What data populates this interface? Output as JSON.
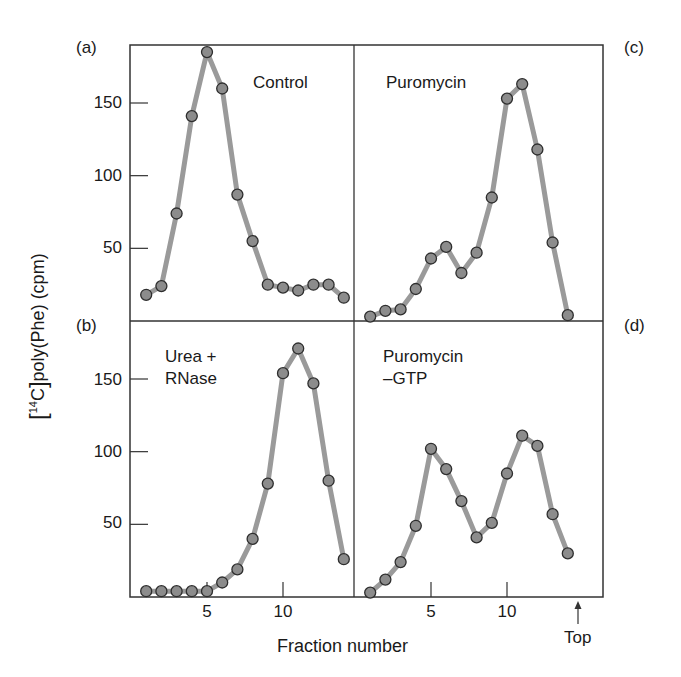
{
  "chart_data": {
    "type": "line",
    "title": "",
    "xlabel": "Fraction number",
    "ylabel": "[14C]poly(Phe) (cpm)",
    "ylabel_parts": {
      "open": "[",
      "sup": "14",
      "iso": "C",
      "close": "]",
      "rest": "poly(Phe) (cpm)"
    },
    "x_top_marker": "Top",
    "grid": false,
    "legend": null,
    "xlim": [
      0,
      16
    ],
    "ylim": [
      0,
      190
    ],
    "x_ticks": [
      5,
      10
    ],
    "y_ticks": [
      50,
      100,
      150
    ],
    "panels": [
      {
        "id": "a",
        "label": "(a)",
        "annotation": "Control",
        "position": "top-left",
        "x": [
          1,
          2,
          3,
          4,
          5,
          6,
          7,
          8,
          9,
          10,
          11,
          12,
          13,
          14
        ],
        "values": [
          18,
          24,
          74,
          141,
          185,
          160,
          87,
          55,
          25,
          23,
          21,
          25,
          25,
          16
        ]
      },
      {
        "id": "b",
        "label": "(b)",
        "annotation": "Urea +\nRNase",
        "position": "bottom-left",
        "x": [
          1,
          2,
          3,
          4,
          5,
          6,
          7,
          8,
          9,
          10,
          11,
          12,
          13,
          14
        ],
        "values": [
          4,
          4,
          4,
          4,
          4,
          10,
          19,
          40,
          78,
          154,
          171,
          147,
          80,
          26
        ]
      },
      {
        "id": "c",
        "label": "(c)",
        "annotation": "Puromycin",
        "position": "top-right",
        "x": [
          1,
          2,
          3,
          4,
          5,
          6,
          7,
          8,
          9,
          10,
          11,
          12,
          13,
          14
        ],
        "values": [
          3,
          7,
          8,
          22,
          43,
          51,
          33,
          47,
          85,
          153,
          163,
          118,
          54,
          4
        ]
      },
      {
        "id": "d",
        "label": "(d)",
        "annotation": "Puromycin\n–GTP",
        "position": "bottom-right",
        "x": [
          1,
          2,
          3,
          4,
          5,
          6,
          7,
          8,
          9,
          10,
          11,
          12,
          13,
          14
        ],
        "values": [
          3,
          12,
          24,
          49,
          102,
          88,
          66,
          41,
          51,
          85,
          111,
          104,
          57,
          30
        ]
      }
    ]
  },
  "style": {
    "line_color": "#9a9a9a",
    "marker_fill": "#8c8c8c",
    "marker_edge": "#2e2e2e",
    "frame_color": "#333333"
  }
}
